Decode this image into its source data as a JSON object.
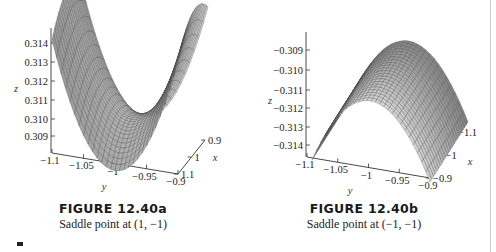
{
  "figures": [
    {
      "id": "12.40a",
      "title": "FIGURE 12.40a",
      "subtitle": "Saddle point at (1, −1)",
      "z_label": "z",
      "y_label": "y",
      "x_label": "x",
      "z_ticks": [
        "0.314",
        "0.313",
        "0.312",
        "0.311",
        "0.310",
        "0.309"
      ],
      "y_ticks": [
        "−1.1",
        "−1.05",
        "−1",
        "−0.95",
        "−0.9"
      ],
      "x_ticks": [
        "0.9",
        "1",
        "1.1"
      ]
    },
    {
      "id": "12.40b",
      "title": "FIGURE 12.40b",
      "subtitle": "Saddle point at (−1, −1)",
      "z_label": "z",
      "y_label": "y",
      "x_label": "x",
      "z_ticks": [
        "−0.309",
        "−0.310",
        "−0.311",
        "−0.312",
        "−0.313",
        "−0.314"
      ],
      "y_ticks": [
        "−1.1",
        "−1.05",
        "−1",
        "−0.95",
        "−0.9"
      ],
      "x_ticks": [
        "−1.1",
        "−1",
        "−0.9"
      ]
    }
  ],
  "chart_data": [
    {
      "type": "surface",
      "title": "FIGURE 12.40a",
      "subtitle": "Saddle point at (1, -1)",
      "xlabel": "x",
      "ylabel": "y",
      "zlabel": "z",
      "xlim": [
        0.9,
        1.1
      ],
      "ylim": [
        -1.1,
        -0.9
      ],
      "zlim": [
        0.309,
        0.314
      ],
      "x_ticks": [
        0.9,
        1,
        1.1
      ],
      "y_ticks": [
        -1.1,
        -1.05,
        -1,
        -0.95,
        -0.9
      ],
      "z_ticks": [
        0.309,
        0.31,
        0.311,
        0.312,
        0.313,
        0.314
      ],
      "critical_point": {
        "x": 1,
        "y": -1,
        "kind": "saddle"
      }
    },
    {
      "type": "surface",
      "title": "FIGURE 12.40b",
      "subtitle": "Saddle point at (-1, -1)",
      "xlabel": "x",
      "ylabel": "y",
      "zlabel": "z",
      "xlim": [
        -1.1,
        -0.9
      ],
      "ylim": [
        -1.1,
        -0.9
      ],
      "zlim": [
        -0.314,
        -0.309
      ],
      "x_ticks": [
        -1.1,
        -1,
        -0.9
      ],
      "y_ticks": [
        -1.1,
        -1.05,
        -1,
        -0.95,
        -0.9
      ],
      "z_ticks": [
        -0.309,
        -0.31,
        -0.311,
        -0.312,
        -0.313,
        -0.314
      ],
      "critical_point": {
        "x": -1,
        "y": -1,
        "kind": "saddle"
      }
    }
  ],
  "colors": {
    "surface_light": "#d9d9d9",
    "surface_mid": "#a8a8a8",
    "surface_dark": "#7a7a7a",
    "mesh": "#3a3a3a",
    "axis": "#333333",
    "margin_rule": "#c8c8c8"
  }
}
